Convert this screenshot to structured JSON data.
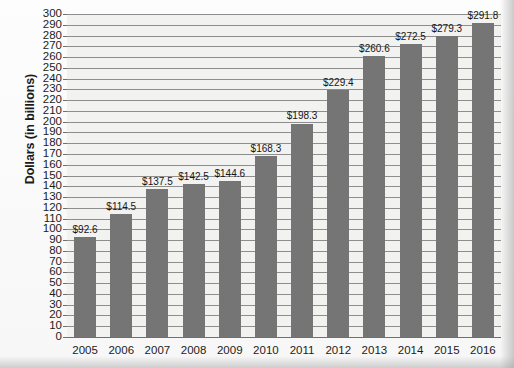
{
  "chart_data": {
    "type": "bar",
    "title": "",
    "xlabel": "",
    "ylabel": "Dollars (in billions)",
    "ylim": [
      0,
      300
    ],
    "ytick_step": 10,
    "grid": true,
    "legend": "none",
    "bar_color": "#757575",
    "plot_background": "#f2f2f0",
    "categories": [
      "2005",
      "2006",
      "2007",
      "2008",
      "2009",
      "2010",
      "2011",
      "2012",
      "2013",
      "2014",
      "2015",
      "2016"
    ],
    "values": [
      92.6,
      114.5,
      137.5,
      142.5,
      144.6,
      168.3,
      198.3,
      229.4,
      260.6,
      272.5,
      279.3,
      291.8
    ],
    "data_labels": [
      "$92.6",
      "$114.5",
      "$137.5",
      "$142.5",
      "$144.6",
      "$168.3",
      "$198.3",
      "$229.4",
      "$260.6",
      "$272.5",
      "$279.3",
      "$291.8"
    ],
    "ytick_labels": [
      "300",
      "290",
      "280",
      "270",
      "260",
      "250",
      "240",
      "230",
      "220",
      "210",
      "200",
      "190",
      "180",
      "170",
      "160",
      "150",
      "140",
      "130",
      "120",
      "110",
      "100",
      "90",
      "80",
      "70",
      "60",
      "50",
      "40",
      "30",
      "20",
      "10",
      "0"
    ]
  }
}
